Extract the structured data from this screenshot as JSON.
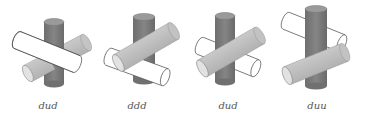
{
  "figure": {
    "colors": {
      "vertical_cylinder": "#7a7a7a",
      "vertical_cylinder_top": "#999999",
      "gray_cylinder": "#bdbdbd",
      "gray_cylinder_end": "#d8d8d8",
      "white_cylinder": "#ffffff",
      "outline": "#555555"
    },
    "panels": [
      {
        "label": "dud"
      },
      {
        "label": "ddd"
      },
      {
        "label": "dud"
      },
      {
        "label": "duu"
      }
    ]
  }
}
